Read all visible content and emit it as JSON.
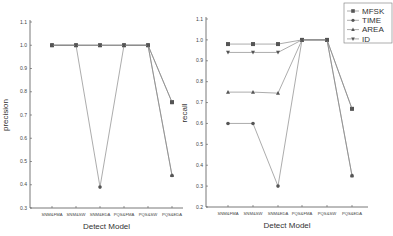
{
  "chart_data": [
    {
      "type": "line",
      "title": "",
      "xlabel": "Detect Model",
      "ylabel": "precision",
      "ylim": [
        0.3,
        1.1
      ],
      "yticks": [
        "0.3",
        "0.4",
        "0.5",
        "0.6",
        "0.7",
        "0.8",
        "0.9",
        "1.0",
        "1.1"
      ],
      "grid": false,
      "categories": [
        "SNM&FMA",
        "SNM&SW",
        "SNM&EDA",
        "PQS&FMA",
        "PQS&SW",
        "PQS&EDA"
      ],
      "series": [
        {
          "name": "MFSK",
          "values": [
            1.0,
            1.0,
            1.0,
            1.0,
            1.0,
            0.755
          ]
        },
        {
          "name": "TIME",
          "values": [
            1.0,
            1.0,
            0.39,
            1.0,
            1.0,
            0.44
          ]
        },
        {
          "name": "AREA",
          "values": [
            1.0,
            1.0,
            1.0,
            1.0,
            1.0,
            0.44
          ]
        },
        {
          "name": "ID",
          "values": [
            1.0,
            1.0,
            1.0,
            1.0,
            1.0,
            0.755
          ]
        }
      ]
    },
    {
      "type": "line",
      "title": "",
      "xlabel": "Detect Model",
      "ylabel": "recall",
      "ylim": [
        0.2,
        1.1
      ],
      "yticks": [
        "0.2",
        "0.3",
        "0.4",
        "0.5",
        "0.6",
        "0.7",
        "0.8",
        "0.9",
        "1.0",
        "1.1"
      ],
      "grid": false,
      "categories": [
        "SNM&FMA",
        "SNM&SW",
        "SNM&EDA",
        "PQS&FMA",
        "PQS&SW",
        "PQS&EDA"
      ],
      "legend_position": "top-right",
      "series": [
        {
          "name": "MFSK",
          "values": [
            0.98,
            0.98,
            0.98,
            1.0,
            1.0,
            0.67
          ]
        },
        {
          "name": "TIME",
          "values": [
            0.6,
            0.6,
            0.3,
            1.0,
            1.0,
            0.35
          ]
        },
        {
          "name": "AREA",
          "values": [
            0.75,
            0.75,
            0.745,
            1.0,
            1.0,
            0.35
          ]
        },
        {
          "name": "ID",
          "values": [
            0.94,
            0.94,
            0.94,
            1.0,
            1.0,
            0.67
          ]
        }
      ]
    }
  ],
  "legend": {
    "items": [
      {
        "label": "MFSK",
        "marker": "square"
      },
      {
        "label": "TIME",
        "marker": "circle"
      },
      {
        "label": "AREA",
        "marker": "triangle-up"
      },
      {
        "label": "ID",
        "marker": "triangle-down"
      }
    ]
  },
  "colors": {
    "line": "#888888",
    "marker": "#555555",
    "axis": "#555555"
  }
}
